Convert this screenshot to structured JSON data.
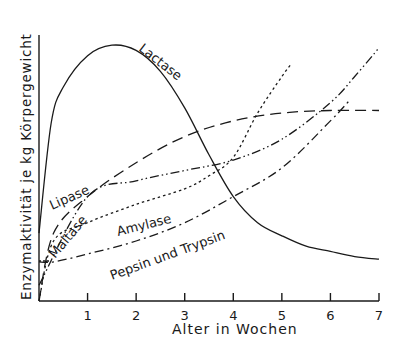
{
  "chart_data": {
    "type": "line",
    "title": "",
    "xlabel": "Alter in Wochen",
    "ylabel": "Enzymaktivität je kg Körpergewicht",
    "xlim": [
      0,
      7
    ],
    "ylim": [
      0,
      1
    ],
    "x_ticks": [
      "1",
      "2",
      "3",
      "4",
      "5",
      "6",
      "7"
    ],
    "y_ticks": [],
    "grid": false,
    "legend": "inline labels on curves",
    "series": [
      {
        "name": "Lactase",
        "style": "solid",
        "x": [
          0,
          0.25,
          0.5,
          1.0,
          1.5,
          2.0,
          2.5,
          3.0,
          3.5,
          4.0,
          4.5,
          5.0,
          5.5,
          6.0,
          6.5,
          7.0
        ],
        "y": [
          0.26,
          0.68,
          0.82,
          0.94,
          0.98,
          0.96,
          0.88,
          0.74,
          0.56,
          0.4,
          0.3,
          0.25,
          0.21,
          0.19,
          0.17,
          0.16
        ]
      },
      {
        "name": "Maltase",
        "style": "long-dash",
        "x": [
          0,
          0.3,
          1.0,
          2.0,
          3.0,
          4.0,
          5.0,
          6.0,
          7.0
        ],
        "y": [
          0.0,
          0.26,
          0.4,
          0.53,
          0.63,
          0.69,
          0.72,
          0.73,
          0.73
        ]
      },
      {
        "name": "Lipase",
        "style": "dash-dot-dot",
        "x": [
          0,
          1.0,
          2.0,
          3.0,
          4.0,
          5.0,
          6.0,
          6.5,
          7.0
        ],
        "y": [
          0.06,
          0.4,
          0.46,
          0.5,
          0.54,
          0.62,
          0.76,
          0.86,
          0.97
        ]
      },
      {
        "name": "Amylase",
        "style": "dotted",
        "x": [
          0,
          0.3,
          1.0,
          2.0,
          3.0,
          3.5,
          4.0,
          4.5,
          5.0,
          5.2
        ],
        "y": [
          0.0,
          0.23,
          0.3,
          0.37,
          0.43,
          0.48,
          0.55,
          0.72,
          0.86,
          0.91
        ]
      },
      {
        "name": "Pepsin und Trypsin",
        "style": "dash-dot",
        "x": [
          0,
          0.3,
          1.0,
          2.0,
          3.0,
          4.0,
          5.0,
          6.0,
          6.4
        ],
        "y": [
          0.15,
          0.15,
          0.18,
          0.23,
          0.3,
          0.4,
          0.51,
          0.69,
          0.77
        ]
      }
    ]
  },
  "labels": {
    "lactase": "Lactase",
    "lipase": "Lipase",
    "maltase": "Maltase",
    "amylase": "Amylase",
    "pepsin": "Pepsin und Trypsin",
    "xlabel": "Alter in Wochen",
    "ylabel": "Enzymaktivität je kg Körpergewicht",
    "ticks": [
      "1",
      "2",
      "3",
      "4",
      "5",
      "6",
      "7"
    ]
  }
}
